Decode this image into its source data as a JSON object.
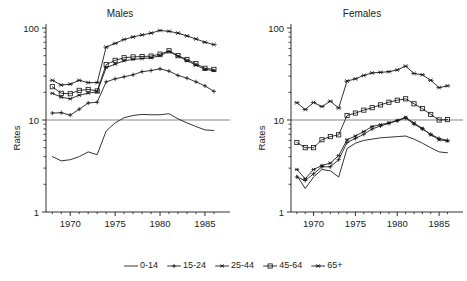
{
  "figure": {
    "background": "#ffffff",
    "line_color": "#111111",
    "axis_color": "#1a1a1a",
    "reference_line_value": 10
  },
  "legend": {
    "position": "bottom-center",
    "entries": [
      {
        "label": "0-14",
        "marker": "none"
      },
      {
        "label": "15-24",
        "marker": "plus"
      },
      {
        "label": "25-44",
        "marker": "asterisk"
      },
      {
        "label": "45-64",
        "marker": "square"
      },
      {
        "label": "65+",
        "marker": "cross-bar"
      }
    ]
  },
  "axes": {
    "ylabel": "Rates",
    "ytick_labels": [
      "100",
      "10",
      "1"
    ],
    "ytick_values": [
      100,
      10,
      1
    ],
    "ylim": [
      1,
      100
    ],
    "yscale": "log",
    "xtick_labels": [
      "1970",
      "1975",
      "1980",
      "1985"
    ],
    "xtick_values": [
      1970,
      1975,
      1980,
      1985
    ],
    "xlim": [
      1967.3,
      1986.9
    ],
    "grid": false
  },
  "chart_data": [
    {
      "type": "line",
      "title": "Males",
      "xlabel": "",
      "ylabel": "Rates",
      "yscale": "log",
      "ylim": [
        1,
        100
      ],
      "xlim": [
        1967.3,
        1986.9
      ],
      "x": [
        1968,
        1969,
        1970,
        1971,
        1972,
        1973,
        1974,
        1975,
        1976,
        1977,
        1978,
        1979,
        1980,
        1981,
        1982,
        1983,
        1984,
        1985,
        1986
      ],
      "series": [
        {
          "name": "0-14",
          "marker": "none",
          "values": [
            4.0,
            3.6,
            3.7,
            4.0,
            4.5,
            4.2,
            7.6,
            9.3,
            10.6,
            11.2,
            11.5,
            11.4,
            11.4,
            11.7,
            10.3,
            9.3,
            8.5,
            7.8,
            7.7
          ]
        },
        {
          "name": "15-24",
          "marker": "plus",
          "values": [
            11.9,
            12.0,
            11.3,
            13.1,
            15.3,
            15.6,
            26.0,
            28.0,
            29.5,
            31.0,
            33.5,
            34.5,
            36.0,
            34.0,
            30.5,
            28.5,
            26.0,
            23.5,
            20.5
          ]
        },
        {
          "name": "25-44",
          "marker": "asterisk",
          "values": [
            19.5,
            17.7,
            17.0,
            18.6,
            19.6,
            20.2,
            37.0,
            40.5,
            44.0,
            45.5,
            46.5,
            47.5,
            50.0,
            55.5,
            49.5,
            44.0,
            39.5,
            35.5,
            34.5
          ]
        },
        {
          "name": "45-64",
          "marker": "square",
          "values": [
            23.0,
            19.5,
            19.3,
            21.0,
            21.5,
            20.7,
            40.0,
            44.5,
            47.5,
            48.5,
            49.0,
            49.5,
            52.0,
            56.5,
            50.0,
            45.5,
            41.0,
            36.5,
            35.5
          ]
        },
        {
          "name": "65+",
          "marker": "cross-bar",
          "values": [
            27.0,
            24.0,
            24.5,
            27.0,
            25.5,
            25.5,
            62.0,
            68.0,
            75.0,
            80.0,
            84.0,
            88.0,
            94.0,
            92.0,
            88.0,
            82.0,
            76.0,
            70.0,
            66.0
          ]
        }
      ]
    },
    {
      "type": "line",
      "title": "Females",
      "xlabel": "",
      "ylabel": "Rates",
      "yscale": "log",
      "ylim": [
        1,
        100
      ],
      "xlim": [
        1967.3,
        1986.9
      ],
      "x": [
        1968,
        1969,
        1970,
        1971,
        1972,
        1973,
        1974,
        1975,
        1976,
        1977,
        1978,
        1979,
        1980,
        1981,
        1982,
        1983,
        1984,
        1985,
        1986
      ],
      "series": [
        {
          "name": "0-14",
          "marker": "none",
          "values": [
            2.5,
            1.8,
            2.4,
            2.9,
            2.8,
            2.4,
            4.9,
            5.6,
            6.0,
            6.2,
            6.4,
            6.5,
            6.6,
            6.7,
            6.2,
            5.6,
            5.0,
            4.5,
            4.4
          ]
        },
        {
          "name": "15-24",
          "marker": "plus",
          "values": [
            2.4,
            2.2,
            2.6,
            3.1,
            3.1,
            3.7,
            5.7,
            6.3,
            7.0,
            8.0,
            8.6,
            9.2,
            9.8,
            10.5,
            9.0,
            8.0,
            7.0,
            6.3,
            6.0
          ]
        },
        {
          "name": "25-44",
          "marker": "asterisk",
          "values": [
            2.9,
            2.3,
            2.9,
            3.2,
            3.4,
            4.1,
            6.1,
            6.7,
            7.5,
            8.5,
            8.9,
            9.3,
            9.9,
            10.7,
            9.3,
            8.1,
            6.9,
            6.1,
            5.9
          ]
        },
        {
          "name": "45-64",
          "marker": "square",
          "values": [
            5.7,
            5.0,
            5.0,
            6.1,
            6.6,
            6.9,
            11.2,
            11.9,
            12.8,
            13.6,
            14.6,
            15.6,
            16.4,
            17.0,
            15.0,
            13.3,
            11.5,
            10.0,
            10.1
          ]
        },
        {
          "name": "65+",
          "marker": "cross-bar",
          "values": [
            15.4,
            13.0,
            15.5,
            14.0,
            16.0,
            13.5,
            26.5,
            28.0,
            30.5,
            32.5,
            33.0,
            33.5,
            35.0,
            38.5,
            32.0,
            31.0,
            27.0,
            22.5,
            23.5
          ]
        }
      ]
    }
  ]
}
